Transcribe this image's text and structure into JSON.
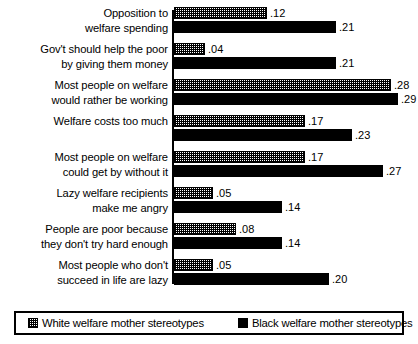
{
  "chart_data": {
    "type": "bar",
    "orientation": "horizontal",
    "title": "",
    "xlabel": "",
    "ylabel": "",
    "xlim": [
      0,
      0.3
    ],
    "grid": false,
    "legend_position": "bottom",
    "categories": [
      "Opposition to\nwelfare spending",
      "Gov't should help the poor\nby giving them money",
      "Most people on welfare\nwould rather be working",
      "Welfare costs too much",
      "Most people on welfare\ncould get by without it",
      "Lazy welfare recipients\nmake me angry",
      "People are poor because\nthey don't try hard enough",
      "Most people who don't\nsucceed in life are lazy"
    ],
    "series": [
      {
        "name": "White welfare mother stereotypes",
        "swatch": "hatched",
        "values": [
          0.12,
          0.04,
          0.28,
          0.17,
          0.17,
          0.05,
          0.08,
          0.05
        ],
        "labels": [
          ".12",
          ".04",
          ".28",
          ".17",
          ".17",
          ".05",
          ".08",
          ".05"
        ]
      },
      {
        "name": "Black welfare mother stereotypes",
        "swatch": "solid-black",
        "values": [
          0.21,
          0.21,
          0.29,
          0.23,
          0.27,
          0.14,
          0.14,
          0.2
        ],
        "labels": [
          ".21",
          ".21",
          ".29",
          ".23",
          ".27",
          ".14",
          ".14",
          ".20"
        ]
      }
    ]
  },
  "legend": {
    "items": [
      {
        "label": "White welfare mother stereotypes"
      },
      {
        "label": "Black welfare mother stereotypes"
      }
    ]
  },
  "colors": {
    "ink": "#000000",
    "background": "#ffffff"
  }
}
